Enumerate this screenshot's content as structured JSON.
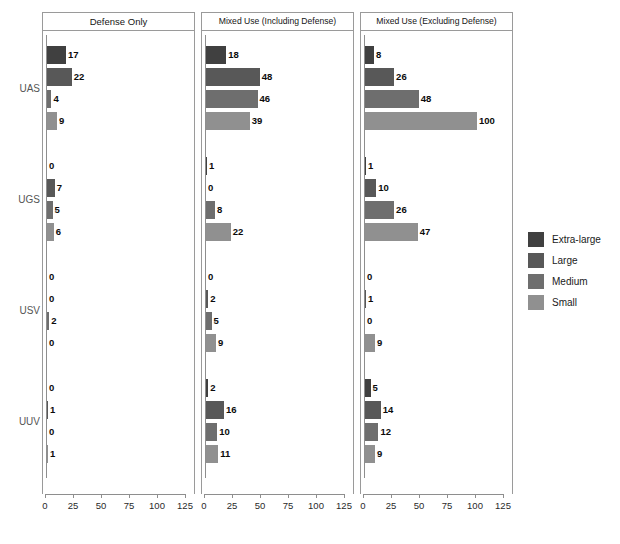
{
  "chart_data": {
    "type": "bar",
    "orientation": "horizontal",
    "title": "",
    "xlabel": "",
    "ylabel": "",
    "xlim": [
      0,
      125
    ],
    "xticks": [
      0,
      25,
      50,
      75,
      100,
      125
    ],
    "grid": false,
    "legend_position": "right",
    "categories": [
      "UAS",
      "UGS",
      "USV",
      "UUV"
    ],
    "size_classes": [
      "Extra-large",
      "Large",
      "Medium",
      "Small"
    ],
    "panels": [
      {
        "label": "Defense Only",
        "series": [
          {
            "name": "Extra-large",
            "values": [
              17,
              0,
              0,
              0
            ]
          },
          {
            "name": "Large",
            "values": [
              22,
              7,
              0,
              1
            ]
          },
          {
            "name": "Medium",
            "values": [
              4,
              5,
              2,
              0
            ]
          },
          {
            "name": "Small",
            "values": [
              9,
              6,
              0,
              1
            ]
          }
        ]
      },
      {
        "label": "Mixed Use (Including Defense)",
        "series": [
          {
            "name": "Extra-large",
            "values": [
              18,
              1,
              0,
              2
            ]
          },
          {
            "name": "Large",
            "values": [
              48,
              0,
              2,
              16
            ]
          },
          {
            "name": "Medium",
            "values": [
              46,
              8,
              5,
              10
            ]
          },
          {
            "name": "Small",
            "values": [
              39,
              22,
              9,
              11
            ]
          }
        ]
      },
      {
        "label": "Mixed Use (Excluding Defense)",
        "series": [
          {
            "name": "Extra-large",
            "values": [
              8,
              1,
              0,
              5
            ]
          },
          {
            "name": "Large",
            "values": [
              26,
              10,
              1,
              14
            ]
          },
          {
            "name": "Medium",
            "values": [
              48,
              26,
              0,
              12
            ]
          },
          {
            "name": "Small",
            "values": [
              100,
              47,
              9,
              9
            ]
          }
        ]
      }
    ],
    "colors": {
      "extra_large": "#404040",
      "large": "#585858",
      "medium": "#6e6e6e",
      "small": "#909090",
      "axis": "#8e8e8e",
      "panel_border": "#9a9a9a",
      "label_text": "#0b0b0b",
      "group_label_text": "#555555"
    }
  },
  "legend": {
    "items": [
      {
        "label": "Extra-large",
        "color": "#404040"
      },
      {
        "label": "Large",
        "color": "#585858"
      },
      {
        "label": "Medium",
        "color": "#6e6e6e"
      },
      {
        "label": "Small",
        "color": "#909090"
      }
    ]
  }
}
